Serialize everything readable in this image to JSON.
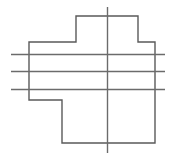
{
  "figure": {
    "canvas": {
      "width": 174,
      "height": 160,
      "background": "#ffffff"
    },
    "colors": {
      "outline": "#5a5a5a",
      "centerline": "#6b6b6b",
      "section_line": "#6b6b6b"
    },
    "stroke_widths": {
      "outline": 1.4,
      "centerline": 1.4,
      "section_line": 1.3
    },
    "outline": {
      "name": "cross-polygon",
      "closed": true,
      "points": [
        [
          76,
          16
        ],
        [
          138,
          16
        ],
        [
          138,
          42
        ],
        [
          155,
          42
        ],
        [
          155,
          143
        ],
        [
          62,
          143
        ],
        [
          62,
          100
        ],
        [
          29,
          100
        ],
        [
          29,
          42
        ],
        [
          76,
          42
        ]
      ],
      "path": "M 76 16 L 138 16 L 138 42 L 155 42 L 155 143 L 62 143 L 62 100 L 29 100 L 29 42 L 76 42 Z"
    },
    "centerline": {
      "name": "vertical-centerline",
      "orientation": "vertical",
      "x": 107.5,
      "y_start": 7,
      "y_end": 153
    },
    "section_lines": [
      {
        "name": "section-line-upper",
        "orientation": "horizontal",
        "y": 54.5,
        "x_start": 11,
        "x_end": 165
      },
      {
        "name": "section-line-middle",
        "orientation": "horizontal",
        "y": 71.5,
        "x_start": 11,
        "x_end": 165
      },
      {
        "name": "section-line-lower",
        "orientation": "horizontal",
        "y": 89.5,
        "x_start": 11,
        "x_end": 165
      }
    ]
  }
}
